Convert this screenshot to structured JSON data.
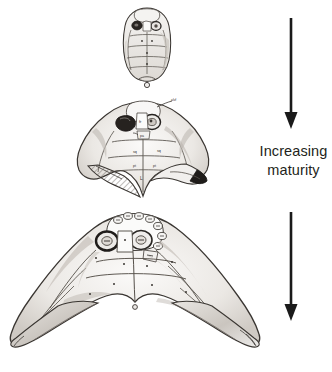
{
  "figure": {
    "background_color": "#ffffff",
    "width": 332,
    "height": 372,
    "ink_color": "#231f20",
    "fill_color": "#f2f0ee",
    "shade_color": "#b9b4ae"
  },
  "annotation": {
    "caption_line_1": "Increasing",
    "caption_line_2": "maturity",
    "caption_color": "#231f20",
    "arrows": [
      {
        "name": "upper-maturity-arrow",
        "direction": "down",
        "x": 291,
        "y_start": 18,
        "y_end": 128
      },
      {
        "name": "lower-maturity-arrow",
        "direction": "down",
        "x": 291,
        "y_start": 212,
        "y_end": 321
      }
    ]
  },
  "specimens": [
    {
      "name": "juvenile-skull",
      "stage_label": "juvenile",
      "order": 1,
      "center_x": 147,
      "center_y": 44,
      "width": 46,
      "height": 74,
      "description": "small narrow rounded skull roof, paired orbits, faint median sutures"
    },
    {
      "name": "subadult-skull",
      "stage_label": "subadult",
      "order": 2,
      "center_x": 143,
      "center_y": 150,
      "width": 116,
      "height": 96,
      "description": "broader chevron skull with short lateral horns, hatched left horn, dark right horn tip"
    },
    {
      "name": "adult-skull",
      "stage_label": "adult",
      "order": 3,
      "center_x": 135,
      "center_y": 288,
      "width": 232,
      "height": 148,
      "description": "wide boomerang skull with long tapering lateral horns and mottled shading"
    }
  ]
}
